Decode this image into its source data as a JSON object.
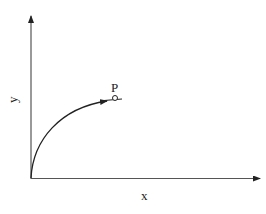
{
  "diagram": {
    "axes": {
      "x_label": "x",
      "y_label": "y"
    },
    "point": {
      "label": "P",
      "marker": "open-circle"
    },
    "curve": {
      "shape": "concave-increasing",
      "starts_at": "origin",
      "ends_with": "arrow-toward-P"
    },
    "colors": {
      "stroke": "#222222",
      "background": "#ffffff"
    }
  }
}
